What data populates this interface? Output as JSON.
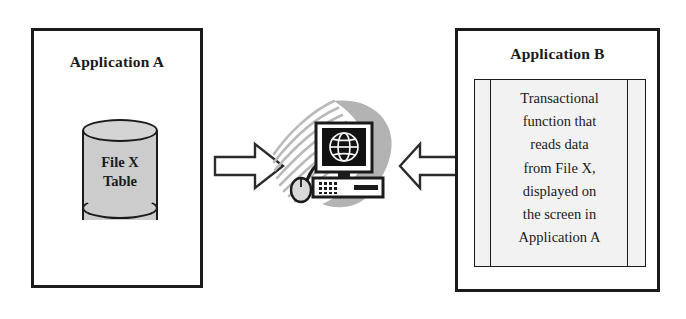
{
  "diagram": {
    "background_color": "#ffffff",
    "outline_color": "#1b1b1b",
    "cylinder_fill": "#cccccc",
    "swoosh_color": "#b3b3b3",
    "screen_color": "#111111"
  },
  "app_a": {
    "title": "Application A",
    "datastore": {
      "icon": "cylinder-database-icon",
      "line1": "File X",
      "line2": "Table"
    }
  },
  "arrows": {
    "left": {
      "icon": "block-arrow-right-icon",
      "direction": "right",
      "label": ""
    },
    "right": {
      "icon": "block-arrow-left-icon",
      "direction": "left",
      "label": ""
    }
  },
  "computer": {
    "icon": "computer-workstation-icon",
    "monitor_icon": "globe-icon",
    "keyboard_icon": "keyboard-icon",
    "mouse_icon": "mouse-icon",
    "swoosh_icon": "swoosh-icon"
  },
  "app_b": {
    "title": "Application B",
    "document": {
      "icon": "document-icon",
      "lines": [
        "Transactional",
        "function that",
        "reads data",
        "from File X,",
        "displayed on",
        "the screen in",
        "Application A"
      ]
    }
  }
}
